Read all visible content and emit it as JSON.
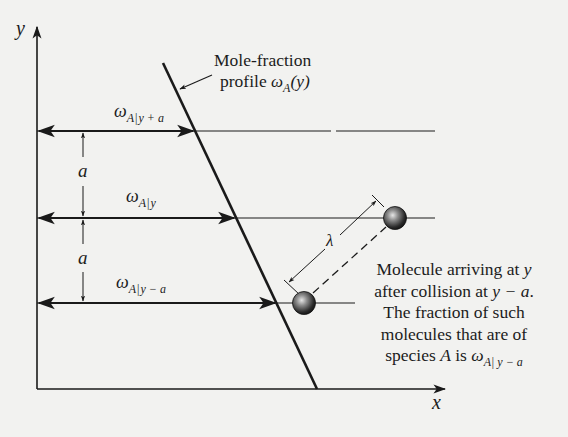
{
  "figure": {
    "axes": {
      "y_label": "y",
      "x_label": "x"
    },
    "profile": {
      "label_line1": "Mole-fraction",
      "label_line2_text": "profile ",
      "label_symbol": "ω",
      "label_sub": "A",
      "label_arg": "(y)"
    },
    "levels": [
      {
        "id": "y-plus-a",
        "symbol": "ω",
        "sub_species": "A",
        "bar": "|",
        "sub_pos": "y + a"
      },
      {
        "id": "y",
        "symbol": "ω",
        "sub_species": "A",
        "bar": "|",
        "sub_pos": "y"
      },
      {
        "id": "y-minus-a",
        "symbol": "ω",
        "sub_species": "A",
        "bar": "|",
        "sub_pos": "y − a"
      }
    ],
    "spacing_labels": [
      "a",
      "a"
    ],
    "mean_free_path_label": "λ",
    "caption": {
      "line1_text": "Molecule arriving at ",
      "line1_var": "y",
      "line2_text": "after collision at ",
      "line2_var": "y − a",
      "line2_end": ".",
      "line3": "The fraction of such",
      "line4": "molecules that are of",
      "line5_text": "species ",
      "line5_var": "A",
      "line5_mid": " is ",
      "line5_symbol": "ω",
      "line5_sub": "A| y − a"
    },
    "colors": {
      "line": "#1a1a1a",
      "background": "#f2f2f0",
      "molecule_dark": "#1e1e1e",
      "molecule_light": "#d8d8d8"
    }
  }
}
